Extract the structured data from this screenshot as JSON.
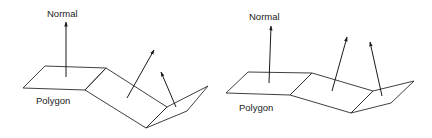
{
  "figures": [
    {
      "id": "left",
      "labels": {
        "normal": "Normal",
        "polygon": "Polygon"
      },
      "polygons": [
        "23,88 45,66 106,68 85,90",
        "85,90 106,68 167,107 146,128",
        "146,128 167,107 208,86 187,111"
      ],
      "normals": [
        {
          "x1": 66,
          "y1": 77,
          "x2": 66,
          "y2": 22
        },
        {
          "x1": 127,
          "y1": 98,
          "x2": 154,
          "y2": 50
        },
        {
          "x1": 176,
          "y1": 107,
          "x2": 161,
          "y2": 72
        }
      ],
      "normal_label_pos": {
        "x": 47,
        "y": 17
      },
      "polygon_label_pos": {
        "x": 36,
        "y": 104
      }
    },
    {
      "id": "right",
      "labels": {
        "normal": "Normal",
        "polygon": "Polygon"
      },
      "polygons": [
        "226,93 248,72 312,73 290,95",
        "290,95 312,73 373,91 351,113",
        "351,113 373,91 414,81 391,103"
      ],
      "normals": [
        {
          "x1": 269,
          "y1": 83,
          "x2": 271,
          "y2": 26
        },
        {
          "x1": 332,
          "y1": 91,
          "x2": 347,
          "y2": 37
        },
        {
          "x1": 382,
          "y1": 96,
          "x2": 370,
          "y2": 42
        }
      ],
      "normal_label_pos": {
        "x": 249,
        "y": 20
      },
      "polygon_label_pos": {
        "x": 239,
        "y": 111
      }
    }
  ]
}
